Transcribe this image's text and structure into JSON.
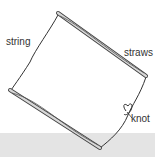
{
  "diagram": {
    "labels": {
      "string": "string",
      "straws": "straws",
      "knot": "knot"
    },
    "colors": {
      "line": "#333333",
      "straw_fill": "#d8d8d8",
      "floor": "#e4e4e4"
    }
  }
}
